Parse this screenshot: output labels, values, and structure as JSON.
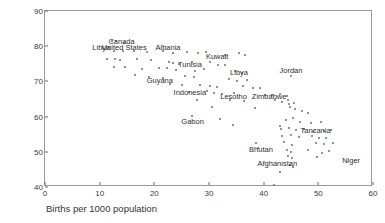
{
  "chart_data": {
    "type": "scatter",
    "title": "",
    "xlabel": "Births per 1000 population",
    "ylabel": "Female life expectancy",
    "xlim": [
      0,
      60
    ],
    "ylim": [
      40,
      90
    ],
    "xticks": [
      0,
      10,
      20,
      30,
      40,
      50,
      60
    ],
    "yticks": [
      40,
      50,
      60,
      70,
      80,
      90
    ],
    "grid": false,
    "legend": null,
    "marker": "open-circle",
    "marker_color": "#6e6e6e",
    "annotations": [
      {
        "label": "Canada",
        "x": 14.0,
        "y": 81.2
      },
      {
        "label": "United States",
        "x": 14.5,
        "y": 79.4
      },
      {
        "label": "Libya",
        "x": 10.3,
        "y": 79.4
      },
      {
        "label": "Albania",
        "x": 22.5,
        "y": 79.5
      },
      {
        "label": "Kuwait",
        "x": 31.5,
        "y": 77.0
      },
      {
        "label": "Tunisia",
        "x": 26.5,
        "y": 74.8
      },
      {
        "label": "Jordan",
        "x": 45.0,
        "y": 73.0
      },
      {
        "label": "Libya",
        "x": 35.5,
        "y": 72.3
      },
      {
        "label": "Guyana",
        "x": 21.0,
        "y": 70.2
      },
      {
        "label": "Indonesia",
        "x": 26.5,
        "y": 66.8
      },
      {
        "label": "Lesotho",
        "x": 34.5,
        "y": 65.5
      },
      {
        "label": "Zimbabwe",
        "x": 41.0,
        "y": 65.5
      },
      {
        "label": "Gabon",
        "x": 27.0,
        "y": 58.5
      },
      {
        "label": "Tanzania",
        "x": 49.5,
        "y": 56.0
      },
      {
        "label": "Bhutan",
        "x": 39.5,
        "y": 50.5
      },
      {
        "label": "Afghanistan",
        "x": 42.5,
        "y": 46.5
      },
      {
        "label": "Niger",
        "x": 56.0,
        "y": 47.5
      }
    ],
    "points": [
      {
        "x": 12.2,
        "y": 81.4
      },
      {
        "x": 13.0,
        "y": 81.5
      },
      {
        "x": 14.4,
        "y": 80.9
      },
      {
        "x": 12.6,
        "y": 78.6
      },
      {
        "x": 14.2,
        "y": 78.5
      },
      {
        "x": 16.3,
        "y": 78.5
      },
      {
        "x": 18.6,
        "y": 78.4
      },
      {
        "x": 21.6,
        "y": 78.6
      },
      {
        "x": 23.4,
        "y": 78.2
      },
      {
        "x": 26.0,
        "y": 78.3
      },
      {
        "x": 28.0,
        "y": 78.0
      },
      {
        "x": 29.4,
        "y": 78.4
      },
      {
        "x": 33.0,
        "y": 77.5
      },
      {
        "x": 35.4,
        "y": 78.0
      },
      {
        "x": 36.6,
        "y": 77.6
      },
      {
        "x": 11.4,
        "y": 76.3
      },
      {
        "x": 12.8,
        "y": 76.4
      },
      {
        "x": 13.8,
        "y": 76.2
      },
      {
        "x": 16.8,
        "y": 76.4
      },
      {
        "x": 19.4,
        "y": 76.0
      },
      {
        "x": 22.6,
        "y": 75.4
      },
      {
        "x": 23.4,
        "y": 75.2
      },
      {
        "x": 24.6,
        "y": 75.0
      },
      {
        "x": 26.8,
        "y": 75.6
      },
      {
        "x": 30.2,
        "y": 75.4
      },
      {
        "x": 31.6,
        "y": 74.8
      },
      {
        "x": 33.0,
        "y": 74.6
      },
      {
        "x": 12.6,
        "y": 74.2
      },
      {
        "x": 14.6,
        "y": 74.0
      },
      {
        "x": 17.8,
        "y": 73.6
      },
      {
        "x": 20.8,
        "y": 73.9
      },
      {
        "x": 22.4,
        "y": 73.8
      },
      {
        "x": 24.0,
        "y": 73.2
      },
      {
        "x": 27.4,
        "y": 73.0
      },
      {
        "x": 29.0,
        "y": 73.4
      },
      {
        "x": 34.8,
        "y": 73.0
      },
      {
        "x": 36.0,
        "y": 72.4
      },
      {
        "x": 45.0,
        "y": 71.5
      },
      {
        "x": 16.4,
        "y": 71.8
      },
      {
        "x": 19.0,
        "y": 71.2
      },
      {
        "x": 21.6,
        "y": 71.0
      },
      {
        "x": 25.6,
        "y": 71.5
      },
      {
        "x": 27.2,
        "y": 71.2
      },
      {
        "x": 33.6,
        "y": 70.6
      },
      {
        "x": 35.2,
        "y": 70.2
      },
      {
        "x": 37.0,
        "y": 70.4
      },
      {
        "x": 22.8,
        "y": 69.2
      },
      {
        "x": 25.0,
        "y": 69.0
      },
      {
        "x": 28.4,
        "y": 69.0
      },
      {
        "x": 30.2,
        "y": 68.8
      },
      {
        "x": 31.4,
        "y": 68.4
      },
      {
        "x": 36.2,
        "y": 68.6
      },
      {
        "x": 38.0,
        "y": 68.0
      },
      {
        "x": 39.4,
        "y": 68.2
      },
      {
        "x": 26.4,
        "y": 67.0
      },
      {
        "x": 29.6,
        "y": 67.2
      },
      {
        "x": 31.0,
        "y": 66.8
      },
      {
        "x": 32.4,
        "y": 66.4
      },
      {
        "x": 34.6,
        "y": 66.6
      },
      {
        "x": 40.2,
        "y": 66.2
      },
      {
        "x": 41.6,
        "y": 66.0
      },
      {
        "x": 43.0,
        "y": 66.4
      },
      {
        "x": 44.2,
        "y": 65.8
      },
      {
        "x": 27.8,
        "y": 64.8
      },
      {
        "x": 33.8,
        "y": 64.6
      },
      {
        "x": 36.4,
        "y": 64.4
      },
      {
        "x": 42.0,
        "y": 64.8
      },
      {
        "x": 43.4,
        "y": 64.2
      },
      {
        "x": 44.4,
        "y": 64.6
      },
      {
        "x": 44.6,
        "y": 63.6
      },
      {
        "x": 45.6,
        "y": 64.0
      },
      {
        "x": 30.6,
        "y": 62.6
      },
      {
        "x": 38.4,
        "y": 62.4
      },
      {
        "x": 44.8,
        "y": 62.8
      },
      {
        "x": 45.8,
        "y": 62.2
      },
      {
        "x": 47.0,
        "y": 61.6
      },
      {
        "x": 48.2,
        "y": 61.0
      },
      {
        "x": 26.8,
        "y": 60.2
      },
      {
        "x": 32.0,
        "y": 59.4
      },
      {
        "x": 44.0,
        "y": 59.0
      },
      {
        "x": 45.4,
        "y": 59.6
      },
      {
        "x": 46.6,
        "y": 58.6
      },
      {
        "x": 48.6,
        "y": 58.2
      },
      {
        "x": 50.4,
        "y": 58.6
      },
      {
        "x": 34.4,
        "y": 57.6
      },
      {
        "x": 43.0,
        "y": 57.2
      },
      {
        "x": 43.2,
        "y": 56.4
      },
      {
        "x": 44.6,
        "y": 56.8
      },
      {
        "x": 46.0,
        "y": 56.2
      },
      {
        "x": 47.4,
        "y": 56.6
      },
      {
        "x": 49.0,
        "y": 55.8
      },
      {
        "x": 51.0,
        "y": 56.0
      },
      {
        "x": 52.4,
        "y": 56.2
      },
      {
        "x": 43.4,
        "y": 54.6
      },
      {
        "x": 45.0,
        "y": 54.8
      },
      {
        "x": 46.4,
        "y": 54.2
      },
      {
        "x": 48.8,
        "y": 54.4
      },
      {
        "x": 50.2,
        "y": 53.8
      },
      {
        "x": 51.4,
        "y": 54.0
      },
      {
        "x": 38.6,
        "y": 52.4
      },
      {
        "x": 43.8,
        "y": 52.8
      },
      {
        "x": 45.2,
        "y": 52.0
      },
      {
        "x": 49.6,
        "y": 52.6
      },
      {
        "x": 51.0,
        "y": 52.2
      },
      {
        "x": 52.6,
        "y": 52.4
      },
      {
        "x": 39.0,
        "y": 51.0
      },
      {
        "x": 44.2,
        "y": 50.6
      },
      {
        "x": 45.0,
        "y": 50.0
      },
      {
        "x": 48.2,
        "y": 50.4
      },
      {
        "x": 50.6,
        "y": 49.8
      },
      {
        "x": 52.0,
        "y": 50.2
      },
      {
        "x": 44.4,
        "y": 48.8
      },
      {
        "x": 45.2,
        "y": 48.2
      },
      {
        "x": 49.8,
        "y": 48.4
      },
      {
        "x": 44.8,
        "y": 46.2
      },
      {
        "x": 45.4,
        "y": 45.6
      },
      {
        "x": 43.0,
        "y": 44.2
      },
      {
        "x": 41.8,
        "y": 40.6
      }
    ]
  }
}
